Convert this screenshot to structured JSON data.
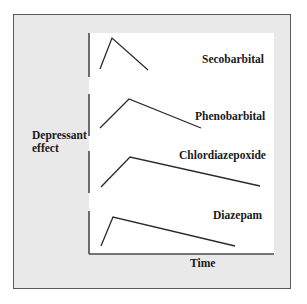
{
  "diagram": {
    "y_axis_label_line1": "Depressant",
    "y_axis_label_line2": "effect",
    "x_axis_label": "Time",
    "colors": {
      "frame_fill": "#e9e9e9",
      "frame_border": "#5a5a5a",
      "plot_fill": "#ffffff",
      "line": "#2a2a2a",
      "axis": "#4a4a4a"
    },
    "curves": [
      {
        "name": "Secobarbital",
        "onset": "rapid",
        "peak": "sharp",
        "duration": "short",
        "points": [
          [
            100,
            69
          ],
          [
            112,
            38
          ],
          [
            148,
            70
          ]
        ]
      },
      {
        "name": "Phenobarbital",
        "onset": "moderate",
        "duration": "intermediate",
        "points": [
          [
            100,
            128
          ],
          [
            129,
            99
          ],
          [
            201,
            128
          ]
        ]
      },
      {
        "name": "Chlordiazepoxide",
        "onset": "moderate",
        "duration": "long",
        "points": [
          [
            101,
            187
          ],
          [
            130,
            157
          ],
          [
            260,
            186
          ]
        ]
      },
      {
        "name": "Diazepam",
        "onset": "rapid",
        "duration": "long",
        "points": [
          [
            101,
            246
          ],
          [
            113,
            217
          ],
          [
            235,
            246
          ]
        ]
      }
    ]
  }
}
